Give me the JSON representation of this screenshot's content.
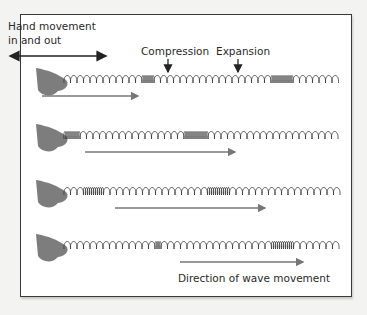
{
  "diagram": {
    "labels": {
      "hand_movement_line1": "Hand movement",
      "hand_movement_line2": "in and out",
      "compression": "Compression",
      "expansion": "Expansion",
      "direction": "Direction of wave movement"
    },
    "rows": [
      {
        "index": 1,
        "compression_zones_x": [
          [
            140,
            152
          ],
          [
            268,
            292
          ]
        ],
        "arrow_x": [
          42,
          138
        ]
      },
      {
        "index": 2,
        "compression_zones_x": [
          [
            58,
            78
          ],
          [
            183,
            206
          ]
        ],
        "arrow_x": [
          85,
          235
        ]
      },
      {
        "index": 3,
        "compression_zones_x": [
          [
            82,
            102
          ],
          [
            207,
            228
          ]
        ],
        "arrow_x": [
          115,
          265
        ]
      },
      {
        "index": 4,
        "compression_zones_x": [
          [
            150,
            160
          ],
          [
            268,
            292
          ]
        ],
        "arrow_x": [
          180,
          303
        ]
      }
    ],
    "colors": {
      "frame_border": "#3a3a3a",
      "spring": "#333333",
      "arrow": "#777777",
      "text": "#2a2a2a",
      "hand": "#7d7d7d"
    }
  }
}
